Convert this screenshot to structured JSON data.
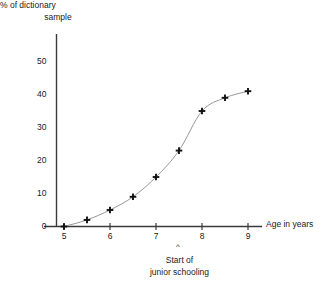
{
  "chart_data": {
    "type": "line",
    "title": "",
    "subtitle": "",
    "xlabel": "Age in years",
    "ylabel": "% of dictionary sample",
    "ylabel_line1": "% of dictionary",
    "ylabel_line2": "sample",
    "x": [
      5,
      5.5,
      6,
      6.5,
      7,
      7.5,
      8,
      8.5,
      9
    ],
    "values": [
      0,
      2,
      5,
      9,
      15,
      23,
      35,
      39,
      41
    ],
    "series": [
      {
        "name": "% of dictionary sample",
        "values": [
          0,
          2,
          5,
          9,
          15,
          23,
          35,
          39,
          41
        ]
      }
    ],
    "xlim": [
      4.7,
      9.45
    ],
    "ylim": [
      0,
      50
    ],
    "xticks": [
      5,
      6,
      7,
      8,
      9
    ],
    "xtick_labels": [
      "5",
      "6",
      "7",
      "8",
      "9"
    ],
    "yticks": [
      0,
      10,
      20,
      30,
      40,
      50
    ],
    "ytick_labels": [
      "0",
      "10",
      "20",
      "30",
      "40",
      "50"
    ],
    "grid": false,
    "legend": false,
    "marker": "plus",
    "line_color": "#8a8a8a",
    "marker_color": "#111111",
    "axis_color": "#3a3a3a",
    "annotations": [
      {
        "text_line1": "Start of",
        "text_line2": "junior schooling",
        "caret": "^",
        "x": 7.5,
        "y": 0
      }
    ]
  },
  "axis": {
    "x_title": "Age in years",
    "y_title_line1": "% of dictionary",
    "y_title_line2": "sample"
  },
  "annotation": {
    "caret": "^",
    "line1": "Start of",
    "line2": "junior schooling"
  }
}
